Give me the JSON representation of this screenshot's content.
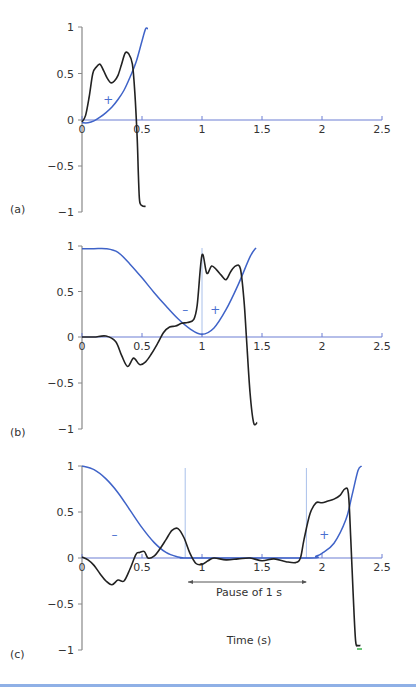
{
  "chart_data": [
    {
      "panel": "(a)",
      "type": "line",
      "xlabel": "",
      "ylabel": "",
      "xlim": [
        0,
        2.5
      ],
      "ylim": [
        -1,
        1
      ],
      "x_ticks": [
        "0",
        "0.5",
        "1",
        "1.5",
        "2",
        "2.5"
      ],
      "y_ticks": [
        "1",
        "0.5",
        "0",
        "-0.5",
        "-1"
      ],
      "annotations": [
        {
          "text": "+",
          "x": 0.22,
          "y": 0.22,
          "color": "#4a6fd0"
        }
      ],
      "vlines": [],
      "series": [
        {
          "name": "position (blue)",
          "color": "#3f63c8",
          "x": [
            0,
            0.05,
            0.1,
            0.15,
            0.2,
            0.25,
            0.3,
            0.35,
            0.4,
            0.45,
            0.5,
            0.53,
            0.55
          ],
          "y": [
            -0.03,
            -0.03,
            -0.01,
            0.03,
            0.08,
            0.14,
            0.22,
            0.32,
            0.46,
            0.62,
            0.85,
            0.98,
            0.98
          ]
        },
        {
          "name": "velocity (black)",
          "color": "#222222",
          "x": [
            0,
            0.03,
            0.06,
            0.09,
            0.12,
            0.15,
            0.18,
            0.21,
            0.24,
            0.27,
            0.3,
            0.33,
            0.36,
            0.39,
            0.42,
            0.44,
            0.46,
            0.47,
            0.48,
            0.5,
            0.53
          ],
          "y": [
            -0.02,
            0.05,
            0.25,
            0.5,
            0.57,
            0.6,
            0.53,
            0.45,
            0.4,
            0.42,
            0.48,
            0.6,
            0.72,
            0.71,
            0.6,
            0.3,
            -0.2,
            -0.6,
            -0.88,
            -0.93,
            -0.94
          ]
        }
      ]
    },
    {
      "panel": "(b)",
      "type": "line",
      "xlim": [
        0,
        2.5
      ],
      "ylim": [
        -1,
        1
      ],
      "x_ticks": [
        "0",
        "0.5",
        "1",
        "1.5",
        "2",
        "2.5"
      ],
      "y_ticks": [
        "1",
        "0.5",
        "0",
        "-0.5",
        "-1"
      ],
      "annotations": [
        {
          "text": "–",
          "x": 0.86,
          "y": 0.3,
          "color": "#4a6fd0"
        },
        {
          "text": "+",
          "x": 1.11,
          "y": 0.3,
          "color": "#4a6fd0"
        }
      ],
      "vlines": [
        1.0
      ],
      "series": [
        {
          "name": "position (blue)",
          "color": "#3f63c8",
          "x": [
            0,
            0.1,
            0.2,
            0.3,
            0.4,
            0.5,
            0.6,
            0.7,
            0.8,
            0.9,
            1.0,
            1.1,
            1.2,
            1.3,
            1.4,
            1.45
          ],
          "y": [
            0.97,
            0.97,
            0.97,
            0.93,
            0.8,
            0.65,
            0.49,
            0.34,
            0.2,
            0.09,
            0.03,
            0.1,
            0.3,
            0.57,
            0.88,
            0.98
          ]
        },
        {
          "name": "velocity (black)",
          "color": "#222222",
          "x": [
            0,
            0.1,
            0.2,
            0.28,
            0.33,
            0.38,
            0.43,
            0.48,
            0.53,
            0.58,
            0.63,
            0.68,
            0.73,
            0.78,
            0.83,
            0.88,
            0.93,
            0.96,
            1.0,
            1.04,
            1.08,
            1.12,
            1.16,
            1.2,
            1.24,
            1.28,
            1.32,
            1.35,
            1.37,
            1.4,
            1.43,
            1.46
          ],
          "y": [
            0,
            0,
            0.01,
            -0.05,
            -0.2,
            -0.32,
            -0.23,
            -0.3,
            -0.27,
            -0.18,
            -0.07,
            0.05,
            0.11,
            0.12,
            0.15,
            0.16,
            0.19,
            0.35,
            0.9,
            0.7,
            0.78,
            0.74,
            0.68,
            0.63,
            0.72,
            0.78,
            0.75,
            0.4,
            0.0,
            -0.6,
            -0.93,
            -0.93
          ]
        }
      ]
    },
    {
      "panel": "(c)",
      "type": "line",
      "xlabel": "Time (s)",
      "xlim": [
        0,
        2.5
      ],
      "ylim": [
        -1,
        1
      ],
      "x_ticks": [
        "0",
        "0.5",
        "1",
        "1.5",
        "2",
        "2.5"
      ],
      "y_ticks": [
        "1",
        "0.5",
        "0",
        "-0.5",
        "-1"
      ],
      "annotations": [
        {
          "text": "–",
          "x": 0.27,
          "y": 0.25,
          "color": "#4a6fd0"
        },
        {
          "text": "+",
          "x": 2.02,
          "y": 0.25,
          "color": "#4a6fd0"
        },
        {
          "text": "Pause of 1 s",
          "x_from": 0.89,
          "x_to": 1.88,
          "arrow": true
        }
      ],
      "vlines": [
        0.86,
        1.87
      ],
      "series": [
        {
          "name": "position (blue)",
          "color": "#3f63c8",
          "x": [
            0,
            0.1,
            0.2,
            0.3,
            0.4,
            0.5,
            0.6,
            0.7,
            0.8,
            0.86,
            0.9,
            1.87,
            1.95,
            2.0,
            2.1,
            2.2,
            2.25,
            2.3,
            2.33
          ],
          "y": [
            1.0,
            0.96,
            0.86,
            0.71,
            0.52,
            0.33,
            0.17,
            0.06,
            0.01,
            0.0,
            0.0,
            0.0,
            0.02,
            0.05,
            0.16,
            0.42,
            0.68,
            0.95,
            1.0
          ]
        },
        {
          "name": "velocity (black)",
          "color": "#222222",
          "x": [
            0,
            0.05,
            0.1,
            0.15,
            0.2,
            0.25,
            0.3,
            0.35,
            0.4,
            0.45,
            0.48,
            0.52,
            0.55,
            0.6,
            0.65,
            0.7,
            0.75,
            0.8,
            0.85,
            0.9,
            0.95,
            1.0,
            1.05,
            1.1,
            1.2,
            1.3,
            1.4,
            1.5,
            1.6,
            1.7,
            1.78,
            1.82,
            1.85,
            1.9,
            1.95,
            2.0,
            2.05,
            2.1,
            2.15,
            2.19,
            2.22,
            2.24,
            2.26,
            2.28,
            2.3,
            2.32
          ],
          "y": [
            0.01,
            -0.02,
            -0.08,
            -0.17,
            -0.25,
            -0.29,
            -0.24,
            -0.25,
            -0.12,
            0.04,
            0.06,
            0.07,
            0.0,
            0.02,
            0.1,
            0.2,
            0.3,
            0.32,
            0.22,
            0.05,
            -0.06,
            -0.07,
            -0.03,
            0.0,
            -0.02,
            -0.01,
            0.0,
            -0.03,
            -0.01,
            -0.04,
            -0.05,
            0.0,
            0.2,
            0.48,
            0.6,
            0.6,
            0.62,
            0.64,
            0.68,
            0.75,
            0.7,
            0.2,
            -0.4,
            -0.9,
            -0.95,
            -0.95
          ]
        }
      ]
    }
  ],
  "figure": {
    "panel_labels": [
      "(a)",
      "(b)",
      "(c)"
    ],
    "x_axis_title": "Time (s)",
    "pause_label": "Pause of 1 s",
    "colors": {
      "position_curve": "#3f63c8",
      "velocity_curve": "#222222",
      "axis_y": "#888888",
      "axis_x": "#6d7fd4",
      "vline": "#a9c0ea",
      "sign": "#4a6fd0",
      "bottom_rule": "#8fb0e6"
    }
  }
}
